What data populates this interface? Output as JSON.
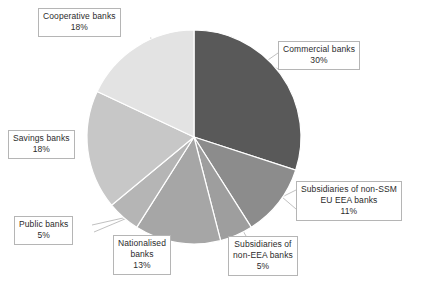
{
  "chart_data": {
    "type": "pie",
    "title": "",
    "subtitle": "",
    "xlabel": "",
    "ylabel": "",
    "legend_position": "none",
    "grid": false,
    "units": "percent",
    "total": 100,
    "start_angle_deg": 0,
    "direction": "clockwise",
    "categories": [
      "Commercial banks",
      "Subsidiaries of non-SSM EU EEA banks",
      "Subsidiaries of non-EEA banks",
      "Nationalised banks",
      "Public banks",
      "Savings banks",
      "Cooperative banks"
    ],
    "values": [
      30,
      11,
      5,
      13,
      5,
      18,
      18
    ],
    "colors": [
      "#595959",
      "#8c8c8c",
      "#9e9e9e",
      "#a6a6a6",
      "#b5b5b5",
      "#c7c7c7",
      "#e3e3e3"
    ],
    "slices": [
      {
        "name": "commercial-banks",
        "label": "Commercial banks",
        "value": 30,
        "value_label": "30%",
        "color": "#595959",
        "start_deg": 0,
        "end_deg": 108
      },
      {
        "name": "subsidiaries-non-ssm-eu-eea-banks",
        "label": "Subsidiaries of non-SSM EU EEA banks",
        "label_line1": "Subsidiaries of non-SSM",
        "label_line2": "EU EEA banks",
        "value": 11,
        "value_label": "11%",
        "color": "#8c8c8c",
        "start_deg": 108,
        "end_deg": 147.6
      },
      {
        "name": "subsidiaries-non-eea-banks",
        "label": "Subsidiaries of non-EEA banks",
        "label_line1": "Subsidiaries of",
        "label_line2": "non-EEA banks",
        "value": 5,
        "value_label": "5%",
        "color": "#9e9e9e",
        "start_deg": 147.6,
        "end_deg": 165.6
      },
      {
        "name": "nationalised-banks",
        "label": "Nationalised banks",
        "label_line1": "Nationalised",
        "label_line2": "banks",
        "value": 13,
        "value_label": "13%",
        "color": "#a6a6a6",
        "start_deg": 165.6,
        "end_deg": 212.4
      },
      {
        "name": "public-banks",
        "label": "Public banks",
        "value": 5,
        "value_label": "5%",
        "color": "#b5b5b5",
        "start_deg": 212.4,
        "end_deg": 230.4
      },
      {
        "name": "savings-banks",
        "label": "Savings banks",
        "value": 18,
        "value_label": "18%",
        "color": "#c7c7c7",
        "start_deg": 230.4,
        "end_deg": 295.2
      },
      {
        "name": "cooperative-banks",
        "label": "Cooperative banks",
        "value": 18,
        "value_label": "18%",
        "color": "#e3e3e3",
        "start_deg": 295.2,
        "end_deg": 360
      }
    ]
  },
  "callouts": {
    "cooperative": {
      "line1": "Cooperative banks",
      "pct": "18%"
    },
    "commercial": {
      "line1": "Commercial banks",
      "pct": "30%"
    },
    "subssm": {
      "line1": "Subsidiaries of non-SSM",
      "line2": "EU EEA banks",
      "pct": "11%"
    },
    "subeea": {
      "line1": "Subsidiaries of",
      "line2": "non-EEA banks",
      "pct": "5%"
    },
    "nationalised": {
      "line1": "Nationalised",
      "line2": "banks",
      "pct": "13%"
    },
    "public": {
      "line1": "Public banks",
      "pct": "5%"
    },
    "savings": {
      "line1": "Savings banks",
      "pct": "18%"
    }
  },
  "style": {
    "background": "#ffffff",
    "slice_border": "#ffffff",
    "callout_border": "#b5b5b5",
    "leader_line": "#b0b0b0",
    "text": "#2b2b2b"
  }
}
